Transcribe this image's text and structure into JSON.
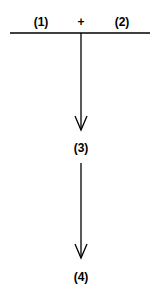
{
  "diagram": {
    "top_labels": {
      "left": "(1)",
      "operator": "+",
      "right": "(2)"
    },
    "middle_label": "(3)",
    "bottom_label": "(4)",
    "line_color": "#000000"
  }
}
